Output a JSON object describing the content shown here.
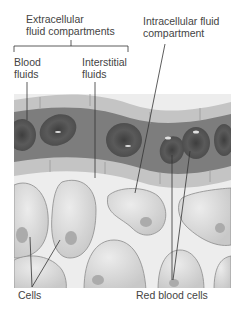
{
  "labels": {
    "extracellular": "Extracellular\nfluid compartments",
    "intracellular": "Intracellular fluid\ncompartment",
    "blood_fluids": "Blood\nfluids",
    "interstitial": "Interstitial\nfluids",
    "cells": "Cells",
    "red_blood_cells": "Red blood cells"
  },
  "colors": {
    "background": "#ffffff",
    "vessel_wall": "#bdbdbd",
    "vessel_lumen": "#7a7a7a",
    "rbc": "#555555",
    "interstitial": "#ececec",
    "cell_fill": "#d6d6d6",
    "nucleus": "#a8a8a8",
    "leader_line": "#333333"
  }
}
